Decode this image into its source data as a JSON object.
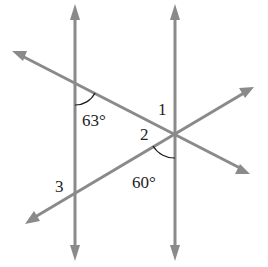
{
  "diagram": {
    "colors": {
      "line": "#8a8a8a",
      "arc": "#1a1a1a",
      "text": "#222222",
      "background": "#ffffff"
    },
    "lines": [
      {
        "id": "vertical-left",
        "x1": 75,
        "y1": 6,
        "x2": 75,
        "y2": 258,
        "arrows": "both"
      },
      {
        "id": "vertical-right",
        "x1": 175,
        "y1": 6,
        "x2": 175,
        "y2": 258,
        "arrows": "both"
      },
      {
        "id": "transversal-descending",
        "x1": 14,
        "y1": 52,
        "x2": 247,
        "y2": 172,
        "arrows": "both"
      },
      {
        "id": "transversal-ascending",
        "x1": 27,
        "y1": 222,
        "x2": 252,
        "y2": 88,
        "arrows": "both"
      }
    ],
    "labels": {
      "angle_63": "63°",
      "angle_60": "60°",
      "angle_1": "1",
      "angle_2": "2",
      "angle_3": "3"
    }
  }
}
